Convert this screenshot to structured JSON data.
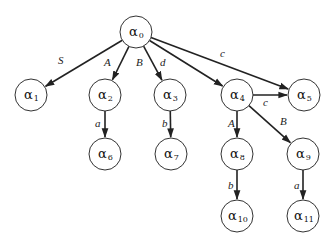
{
  "diagram": {
    "type": "tree",
    "nodes": [
      {
        "id": "a0",
        "symbol": "α",
        "sub": "0",
        "x": 136,
        "y": 32
      },
      {
        "id": "a1",
        "symbol": "α",
        "sub": "1",
        "x": 31,
        "y": 95
      },
      {
        "id": "a2",
        "symbol": "α",
        "sub": "2",
        "x": 105,
        "y": 95
      },
      {
        "id": "a3",
        "symbol": "α",
        "sub": "3",
        "x": 170,
        "y": 95
      },
      {
        "id": "a4",
        "symbol": "α",
        "sub": "4",
        "x": 237,
        "y": 95
      },
      {
        "id": "a5",
        "symbol": "α",
        "sub": "5",
        "x": 304,
        "y": 95
      },
      {
        "id": "a6",
        "symbol": "α",
        "sub": "6",
        "x": 105,
        "y": 154
      },
      {
        "id": "a7",
        "symbol": "α",
        "sub": "7",
        "x": 171,
        "y": 154
      },
      {
        "id": "a8",
        "symbol": "α",
        "sub": "8",
        "x": 237,
        "y": 154
      },
      {
        "id": "a9",
        "symbol": "α",
        "sub": "9",
        "x": 303,
        "y": 154
      },
      {
        "id": "a10",
        "symbol": "α",
        "sub": "10",
        "x": 237,
        "y": 216
      },
      {
        "id": "a11",
        "symbol": "α",
        "sub": "11",
        "x": 303,
        "y": 216
      }
    ],
    "edges": [
      {
        "from": "a0",
        "to": "a1",
        "label": "S",
        "lx": 58,
        "ly": 64
      },
      {
        "from": "a0",
        "to": "a2",
        "label": "A",
        "lx": 104,
        "ly": 66
      },
      {
        "from": "a0",
        "to": "a3",
        "label": "B",
        "lx": 136,
        "ly": 66
      },
      {
        "from": "a0",
        "to": "a4",
        "label": "d",
        "lx": 160,
        "ly": 66
      },
      {
        "from": "a0",
        "to": "a5",
        "label": "c",
        "lx": 220,
        "ly": 57
      },
      {
        "from": "a4",
        "to": "a5",
        "label": "c",
        "lx": 263,
        "ly": 106
      },
      {
        "from": "a2",
        "to": "a6",
        "label": "a",
        "lx": 95,
        "ly": 127
      },
      {
        "from": "a3",
        "to": "a7",
        "label": "b",
        "lx": 162,
        "ly": 127
      },
      {
        "from": "a4",
        "to": "a8",
        "label": "A",
        "lx": 228,
        "ly": 127
      },
      {
        "from": "a4",
        "to": "a9",
        "label": "B",
        "lx": 280,
        "ly": 125
      },
      {
        "from": "a8",
        "to": "a10",
        "label": "b",
        "lx": 228,
        "ly": 189
      },
      {
        "from": "a9",
        "to": "a11",
        "label": "a",
        "lx": 294,
        "ly": 189
      }
    ],
    "node_radius": 16
  }
}
